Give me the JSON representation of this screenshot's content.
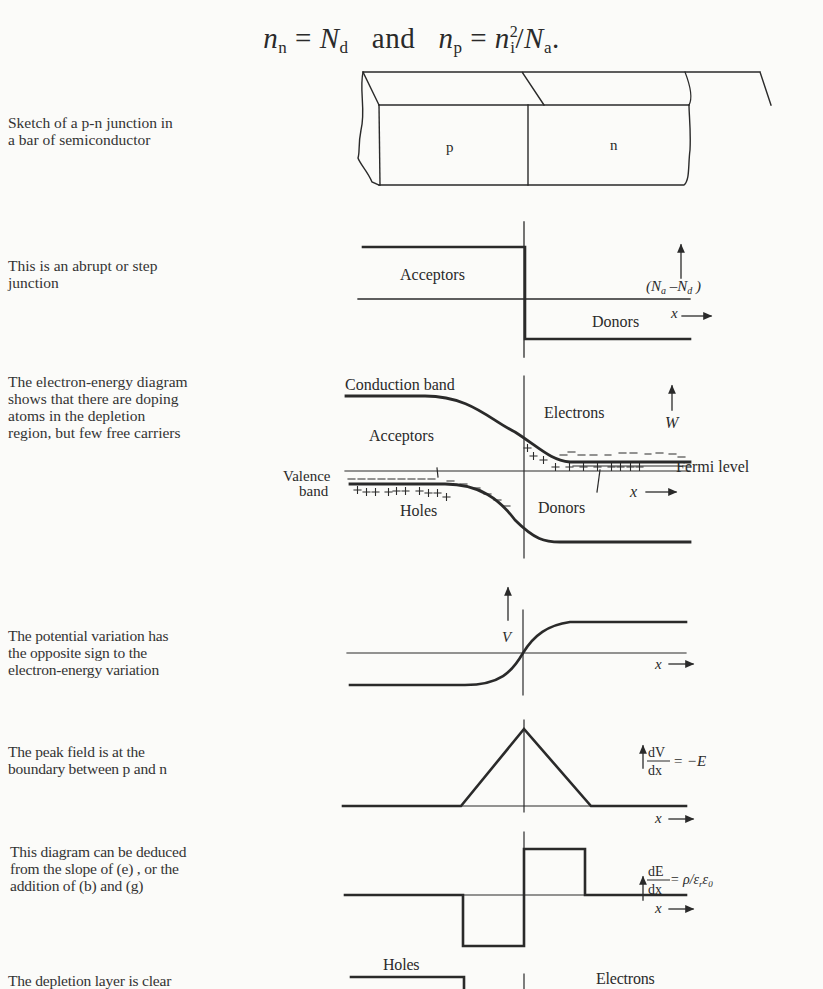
{
  "equation": {
    "lhs1": "n",
    "lhs1_sub": "n",
    "rhs1": "N",
    "rhs1_sub": "d",
    "conj": "and",
    "lhs2": "n",
    "lhs2_sub": "p",
    "rhs2_num": "n",
    "rhs2_num_sub": "i",
    "rhs2_num_sup": "2",
    "rhs2_den": "N",
    "rhs2_den_sub": "a",
    "end": "."
  },
  "panels": [
    {
      "id": "a",
      "caption": "Sketch of a p-n junction in\na bar of semiconductor",
      "labels": {
        "p_region": "p",
        "n_region": "n"
      }
    },
    {
      "id": "b",
      "caption": "This is an abrupt or step\njunction",
      "labels": {
        "acceptors": "Acceptors",
        "donors": "Donors",
        "y_axis": "(Na −Nd)",
        "x_axis": "x"
      }
    },
    {
      "id": "c",
      "caption": "The electron-energy diagram\nshows that there are doping\natoms in the depletion\nregion, but few free carriers",
      "labels": {
        "conduction_band": "Conduction band",
        "electrons": "Electrons",
        "acceptors": "Acceptors",
        "valence_band_1": "Valence",
        "valence_band_2": "band",
        "holes": "Holes",
        "donors": "Donors",
        "fermi_level": "Fermi level",
        "y_axis": "W",
        "x_axis": "x"
      }
    },
    {
      "id": "d",
      "caption": "The potential  variation has\nthe opposite sign to the\nelectron-energy variation",
      "labels": {
        "y_axis": "V",
        "x_axis": "x"
      }
    },
    {
      "id": "e",
      "caption": "The peak field is at the\nboundary between p and n",
      "labels": {
        "y_num": "dV",
        "y_den": "dx",
        "y_rhs": "= −E",
        "x_axis": "x"
      }
    },
    {
      "id": "f",
      "caption": "This diagram can be deduced\nfrom the slope of (e) , or the\naddition of (b) and (g)",
      "labels": {
        "y_num": "dE",
        "y_den": "dx",
        "y_rhs": "= ρ/ε",
        "y_rhs_sub1": "r",
        "y_rhs_2": "ε",
        "y_rhs_sub2": "0",
        "x_axis": "x"
      }
    },
    {
      "id": "g",
      "caption": "The depletion layer is clear",
      "labels": {
        "holes": "Holes",
        "electrons": "Electrons"
      }
    }
  ],
  "colors": {
    "ink": "#2a2a2a",
    "paper": "#fbfbf9"
  }
}
